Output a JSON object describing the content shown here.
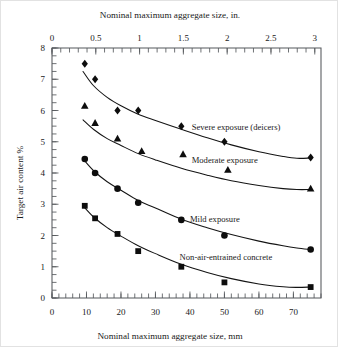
{
  "chart_data": {
    "type": "scatter",
    "title": "",
    "xlabel": "Nominal maximum aggregate size, mm",
    "xlabel_top": "Nominal maximum aggregate size, in.",
    "ylabel": "Target air content %",
    "xlim": [
      0,
      78
    ],
    "ylim": [
      0,
      8
    ],
    "xlim_top": [
      0,
      3.071
    ],
    "grid": false,
    "legend_position": "inline-annotations",
    "x_ticks_bottom": [
      0,
      10,
      20,
      30,
      40,
      50,
      60,
      70
    ],
    "x_ticks_bottom_labels": [
      "0",
      "10",
      "20",
      "30",
      "40",
      "50",
      "60",
      "70"
    ],
    "x_minor_step_bottom": 2,
    "x_ticks_top": [
      0,
      0.5,
      1,
      1.5,
      2,
      2.5,
      3
    ],
    "x_ticks_top_labels": [
      "0",
      "0.5",
      "1",
      "1.5",
      "2",
      "2.5",
      "3"
    ],
    "x_minor_step_top": 0.1,
    "y_ticks": [
      0,
      1,
      2,
      3,
      4,
      5,
      6,
      7,
      8
    ],
    "y_ticks_labels": [
      "0",
      "1",
      "2",
      "3",
      "4",
      "5",
      "6",
      "7",
      "8"
    ],
    "y_minor_step": 0.25,
    "series": [
      {
        "name": "Severe exposure (deicers)",
        "marker": "diamond",
        "color": "#0d0d0d",
        "label_x_mm": 40.5,
        "label_y": 5.48,
        "x": [
          9.5,
          12.5,
          19.0,
          25.0,
          37.5,
          50.0,
          75.0
        ],
        "y": [
          7.5,
          7.0,
          6.0,
          6.0,
          5.5,
          5.0,
          4.5
        ],
        "curve_x": [
          9.0,
          12.0,
          16.0,
          20.0,
          25.0,
          30.0,
          37.5,
          45.0,
          52.0,
          60.0,
          67.0,
          71.0,
          75.0
        ],
        "curve_y": [
          7.25,
          6.8,
          6.42,
          6.15,
          5.88,
          5.68,
          5.4,
          5.13,
          4.9,
          4.68,
          4.53,
          4.47,
          4.48
        ]
      },
      {
        "name": "Moderate exposure",
        "marker": "triangle",
        "color": "#0d0d0d",
        "label_x_mm": 40.5,
        "label_y": 4.42,
        "x": [
          9.5,
          12.5,
          19.0,
          26.0,
          38.0,
          51.0,
          75.0
        ],
        "y": [
          6.15,
          5.6,
          5.1,
          4.7,
          4.6,
          4.1,
          3.5
        ],
        "curve_x": [
          9.0,
          12.0,
          16.0,
          20.0,
          25.0,
          30.0,
          37.5,
          45.0,
          52.0,
          60.0,
          67.0,
          71.0,
          75.0
        ],
        "curve_y": [
          5.7,
          5.4,
          5.1,
          4.88,
          4.62,
          4.42,
          4.15,
          3.93,
          3.75,
          3.6,
          3.5,
          3.47,
          3.47
        ]
      },
      {
        "name": "Mild exposure",
        "marker": "circle",
        "color": "#0d0d0d",
        "label_x_mm": 40.0,
        "label_y": 2.52,
        "x": [
          9.5,
          12.5,
          19.0,
          25.0,
          37.5,
          50.0,
          75.0
        ],
        "y": [
          4.45,
          4.0,
          3.5,
          3.05,
          2.5,
          2.0,
          1.55
        ],
        "curve_x": [
          9.0,
          12.0,
          16.0,
          20.0,
          25.0,
          30.0,
          37.5,
          45.0,
          52.0,
          60.0,
          67.0,
          71.0,
          75.0
        ],
        "curve_y": [
          4.45,
          4.08,
          3.72,
          3.45,
          3.12,
          2.88,
          2.52,
          2.25,
          2.03,
          1.82,
          1.67,
          1.6,
          1.55
        ]
      },
      {
        "name": "Non-air-entrained concrete",
        "marker": "square",
        "color": "#0d0d0d",
        "label_x_mm": 37.0,
        "label_y": 1.33,
        "x": [
          9.5,
          12.5,
          19.0,
          25.0,
          37.5,
          50.0,
          75.0
        ],
        "y": [
          2.95,
          2.55,
          2.05,
          1.5,
          1.0,
          0.5,
          0.35
        ],
        "curve_x": [
          9.0,
          12.0,
          16.0,
          20.0,
          25.0,
          30.0,
          37.5,
          45.0,
          52.0,
          60.0,
          67.0,
          71.0,
          75.0
        ],
        "curve_y": [
          2.95,
          2.6,
          2.25,
          1.98,
          1.67,
          1.42,
          1.08,
          0.82,
          0.62,
          0.45,
          0.36,
          0.34,
          0.35
        ]
      }
    ]
  },
  "axes": {
    "top_title": "Nominal maximum aggregate size, in.",
    "bottom_title": "Nominal maximum aggregate size, mm",
    "left_title": "Target air content %"
  }
}
